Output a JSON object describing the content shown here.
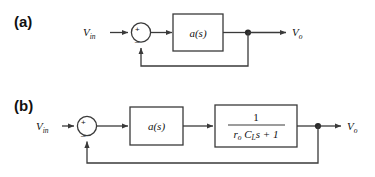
{
  "figure": {
    "kind": "block-diagram",
    "background_color": "#ffffff",
    "line_color": "#3a3a3a",
    "text_color": "#111111",
    "panels": [
      {
        "id": "a",
        "label": "(a)",
        "input_label": "V",
        "input_sub": "in",
        "output_label": "V",
        "output_sub": "o",
        "summing_junction": {
          "name": "summing-junction",
          "plus_sign": "+",
          "minus_sign": "_"
        },
        "blocks": [
          {
            "name": "gain-block",
            "text": "a(s)"
          }
        ],
        "feedback": "unity"
      },
      {
        "id": "b",
        "label": "(b)",
        "input_label": "V",
        "input_sub": "in",
        "output_label": "V",
        "output_sub": "o",
        "summing_junction": {
          "name": "summing-junction",
          "plus_sign": "+",
          "minus_sign": "_"
        },
        "blocks": [
          {
            "name": "gain-block",
            "text": "a(s)"
          },
          {
            "name": "pole-block",
            "numerator": "1",
            "denominator_r": "r",
            "denominator_r_sub": "o",
            "denominator_c": "C",
            "denominator_c_sub": "L",
            "denominator_tail": "s + 1"
          }
        ],
        "feedback": "unity"
      }
    ]
  }
}
